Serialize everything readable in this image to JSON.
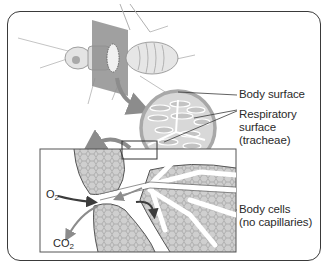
{
  "diagram": {
    "labels": {
      "body_surface": "Body surface",
      "respiratory_surface": {
        "line1": "Respiratory",
        "line2": "surface",
        "line3": "(tracheae)"
      },
      "body_cells": {
        "line1": "Body cells",
        "line2": "(no capillaries)"
      },
      "o2": {
        "base": "O",
        "sub": "2"
      },
      "co2": {
        "base": "CO",
        "sub": "2"
      }
    },
    "colors": {
      "frame": "#3a3a3a",
      "tissue_fill": "#c9c9c9",
      "cross_section": "#bdbdbd",
      "arrow_gray": "#8c8c8c",
      "arrow_dark": "#3c3c3c",
      "insect_plane": "#8f8f8f",
      "text": "#2a2a2a"
    }
  }
}
